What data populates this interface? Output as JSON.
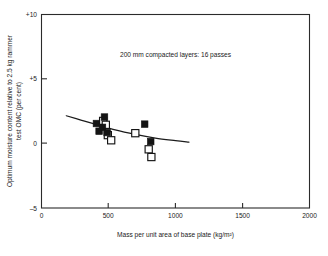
{
  "chart_data": {
    "type": "scatter",
    "title": "",
    "subtitle": "",
    "xlabel": "Mass per unit area of base plate (kg/m²)",
    "ylabel": "Optimum moisture content relative to 2.5 kg rammer test OMC (per cent)",
    "xlim": [
      0,
      2000
    ],
    "ylim": [
      -5,
      10
    ],
    "xticks": [
      0,
      500,
      1000,
      1500,
      2000
    ],
    "xticklabels": [
      "0",
      "500",
      "1000",
      "1500",
      "2000"
    ],
    "yticks": [
      -5,
      0,
      5,
      10
    ],
    "yticklabels": [
      "–5",
      "0",
      "+5",
      "+10"
    ],
    "grid": false,
    "legend": null,
    "annotations": [
      {
        "text": "200 mm compacted layers: 16 passes",
        "x": 1000,
        "y": 6.6
      }
    ],
    "series": [
      {
        "name": "filled-squares",
        "marker": "filled-square",
        "points": [
          {
            "x": 410,
            "y": 1.55
          },
          {
            "x": 430,
            "y": 0.95
          },
          {
            "x": 455,
            "y": 1.25
          },
          {
            "x": 470,
            "y": 2.05
          },
          {
            "x": 490,
            "y": 0.85
          },
          {
            "x": 770,
            "y": 1.5
          },
          {
            "x": 815,
            "y": 0.15
          }
        ]
      },
      {
        "name": "open-squares",
        "marker": "open-square",
        "points": [
          {
            "x": 460,
            "y": 1.75
          },
          {
            "x": 480,
            "y": 1.45
          },
          {
            "x": 495,
            "y": 0.65
          },
          {
            "x": 520,
            "y": 0.25
          },
          {
            "x": 700,
            "y": 0.8
          },
          {
            "x": 800,
            "y": -0.45
          },
          {
            "x": 820,
            "y": -1.05
          }
        ]
      }
    ],
    "trend": {
      "name": "fitted-curve",
      "points": [
        {
          "x": 185,
          "y": 2.15
        },
        {
          "x": 300,
          "y": 1.8
        },
        {
          "x": 420,
          "y": 1.45
        },
        {
          "x": 550,
          "y": 1.05
        },
        {
          "x": 700,
          "y": 0.7
        },
        {
          "x": 850,
          "y": 0.42
        },
        {
          "x": 1000,
          "y": 0.22
        },
        {
          "x": 1100,
          "y": 0.1
        }
      ]
    }
  },
  "figure": {
    "xlabel": "Mass per unit area of base plate (kg/m²)",
    "ylabel_line1": "Optimum moisture content relative to 2.5 kg rammer",
    "ylabel_line2": "test OMC (per cent)",
    "annotation": "200 mm compacted layers: 16 passes",
    "xtick_0": "0",
    "xtick_1": "500",
    "xtick_2": "1000",
    "xtick_3": "1500",
    "xtick_4": "2000",
    "ytick_0": "–5",
    "ytick_1": "0",
    "ytick_2": "+5",
    "ytick_3": "+10"
  },
  "colors": {
    "axis": "#2b2b2b",
    "text": "#1a1a1a",
    "marker_filled": "#141414",
    "marker_open_stroke": "#141414",
    "marker_open_fill": "#ffffff",
    "trendline": "#1c1c1c",
    "background": "#ffffff"
  }
}
